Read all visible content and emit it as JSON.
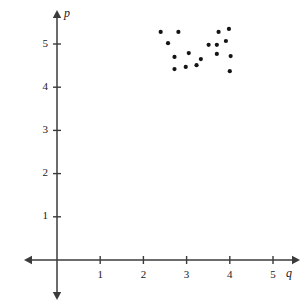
{
  "chart_data": {
    "type": "scatter",
    "title": "",
    "xlabel": "q",
    "ylabel": "p",
    "xlim": [
      0,
      5.6
    ],
    "ylim": [
      0,
      5.6
    ],
    "xticks": [
      1,
      2,
      3,
      4,
      5
    ],
    "yticks": [
      1,
      2,
      3,
      4,
      5
    ],
    "xtick_labels": [
      "1",
      "2",
      "3",
      "4",
      "5"
    ],
    "ytick_labels": [
      "1",
      "2",
      "3",
      "4",
      "5"
    ],
    "grid": false,
    "legend": null,
    "axis_style": "double-arrow-cartesian",
    "point_count": 17,
    "points": [
      {
        "q": 2.4,
        "p": 5.28
      },
      {
        "q": 2.81,
        "p": 5.28
      },
      {
        "q": 2.57,
        "p": 5.02
      },
      {
        "q": 2.72,
        "p": 4.7
      },
      {
        "q": 2.72,
        "p": 4.42
      },
      {
        "q": 3.05,
        "p": 4.79
      },
      {
        "q": 2.98,
        "p": 4.47
      },
      {
        "q": 3.23,
        "p": 4.51
      },
      {
        "q": 3.33,
        "p": 4.65
      },
      {
        "q": 3.51,
        "p": 4.98
      },
      {
        "q": 3.7,
        "p": 4.98
      },
      {
        "q": 3.7,
        "p": 4.77
      },
      {
        "q": 3.74,
        "p": 5.28
      },
      {
        "q": 3.91,
        "p": 5.07
      },
      {
        "q": 3.98,
        "p": 5.35
      },
      {
        "q": 4.02,
        "p": 4.72
      },
      {
        "q": 4.0,
        "p": 4.37
      }
    ],
    "colors": {
      "point": "#141414",
      "axis": "#3b3b3b",
      "text": "#1a1a1a",
      "background": "#ffffff"
    }
  },
  "figure": {
    "origin_px": {
      "x": 57,
      "y": 260
    },
    "unit_px": 43.2
  }
}
